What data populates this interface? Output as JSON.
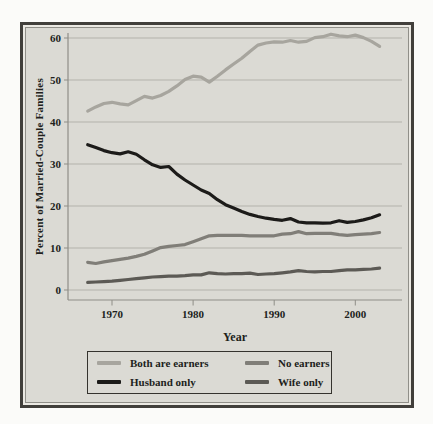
{
  "figure": {
    "y_axis_title": "Percent of Married-Couple Families",
    "x_axis_title": "Year",
    "y_tick_labels": [
      0,
      10,
      20,
      30,
      40,
      50,
      60
    ],
    "x_tick_labels": [
      1970,
      1980,
      1990,
      2000
    ]
  },
  "colors": {
    "panel_background": "#dbdad4",
    "panel_border": "#413f3b",
    "gridline": "#b3b2ab",
    "axis": "#8f8e87",
    "text": "#211f1c",
    "both_earners": "#a7a59e",
    "husband_only": "#1c1b19",
    "no_earners": "#807e78",
    "wife_only": "#5c5a55"
  },
  "chart_data": {
    "type": "line",
    "title": "",
    "xlabel": "Year",
    "ylabel": "Percent of Married-Couple Families",
    "grid": true,
    "legend_position": "bottom",
    "xlim": [
      1965,
      2006
    ],
    "ylim": [
      0,
      62
    ],
    "x": [
      1967,
      1968,
      1969,
      1970,
      1971,
      1972,
      1973,
      1974,
      1975,
      1976,
      1977,
      1978,
      1979,
      1980,
      1981,
      1982,
      1983,
      1984,
      1985,
      1986,
      1987,
      1988,
      1989,
      1990,
      1991,
      1992,
      1993,
      1994,
      1995,
      1996,
      1997,
      1998,
      1999,
      2000,
      2001,
      2002,
      2003
    ],
    "series": [
      {
        "name": "Both are earners",
        "color": "#a7a59e",
        "values": [
          42.6,
          43.6,
          44.4,
          44.7,
          44.3,
          44.1,
          45.1,
          46.1,
          45.7,
          46.3,
          47.3,
          48.6,
          50.1,
          50.9,
          50.7,
          49.5,
          50.9,
          52.4,
          53.8,
          55.2,
          56.8,
          58.3,
          58.8,
          59.1,
          59.0,
          59.4,
          59.0,
          59.2,
          60.1,
          60.3,
          60.9,
          60.5,
          60.3,
          60.7,
          60.1,
          59.2,
          58.0
        ]
      },
      {
        "name": "Husband only",
        "color": "#1c1b19",
        "values": [
          34.6,
          33.9,
          33.2,
          32.7,
          32.4,
          32.9,
          32.3,
          31.0,
          29.8,
          29.2,
          29.4,
          27.6,
          26.2,
          25.0,
          23.8,
          23.0,
          21.5,
          20.3,
          19.5,
          18.7,
          18.0,
          17.5,
          17.1,
          16.8,
          16.6,
          17.0,
          16.2,
          16.0,
          16.0,
          15.9,
          16.0,
          16.5,
          16.1,
          16.3,
          16.7,
          17.2,
          17.9
        ]
      },
      {
        "name": "No earners",
        "color": "#807e78",
        "values": [
          6.6,
          6.3,
          6.7,
          7.0,
          7.3,
          7.6,
          8.0,
          8.5,
          9.3,
          10.1,
          10.4,
          10.6,
          10.8,
          11.5,
          12.2,
          12.9,
          13.0,
          13.0,
          13.0,
          13.0,
          12.9,
          12.9,
          12.9,
          12.9,
          13.3,
          13.4,
          13.9,
          13.4,
          13.5,
          13.5,
          13.5,
          13.2,
          13.0,
          13.2,
          13.3,
          13.4,
          13.7
        ]
      },
      {
        "name": "Wife only",
        "color": "#5c5a55",
        "values": [
          1.8,
          1.9,
          2.0,
          2.1,
          2.3,
          2.5,
          2.7,
          2.9,
          3.1,
          3.2,
          3.3,
          3.3,
          3.4,
          3.6,
          3.6,
          4.1,
          3.9,
          3.8,
          3.9,
          3.9,
          4.0,
          3.7,
          3.8,
          3.9,
          4.1,
          4.3,
          4.6,
          4.4,
          4.3,
          4.4,
          4.4,
          4.6,
          4.8,
          4.8,
          4.9,
          5.0,
          5.2
        ]
      }
    ]
  },
  "legend": {
    "order_note": "two columns",
    "items": [
      "Both are earners",
      "No earners",
      "Husband only",
      "Wife only"
    ]
  }
}
